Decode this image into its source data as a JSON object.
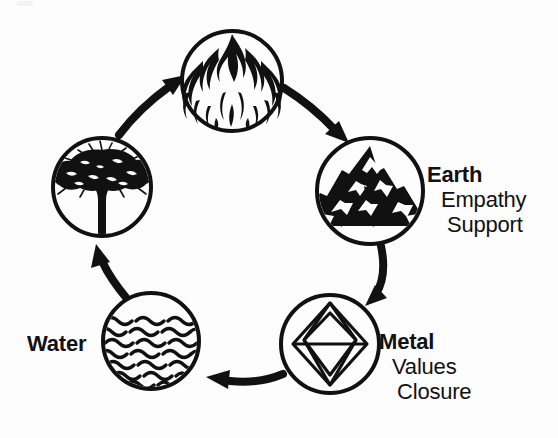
{
  "diagram": {
    "type": "cycle",
    "direction": "clockwise",
    "background_color": "#fdfdfd",
    "stroke_color": "#111111"
  },
  "nodes": [
    {
      "id": "fire",
      "icon": "flame-icon",
      "element": "Fire",
      "cx": 232,
      "cy": 81,
      "r": 51
    },
    {
      "id": "earth",
      "icon": "mountain-icon",
      "element": "Earth",
      "cx": 370,
      "cy": 191,
      "r": 54
    },
    {
      "id": "metal",
      "icon": "diamond-icon",
      "element": "Metal",
      "cx": 330,
      "cy": 344,
      "r": 50
    },
    {
      "id": "water",
      "icon": "waves-icon",
      "element": "Water",
      "cx": 151,
      "cy": 341,
      "r": 49
    },
    {
      "id": "wood",
      "icon": "tree-icon",
      "element": "Wood",
      "cx": 102,
      "cy": 187,
      "r": 50
    }
  ],
  "arrows": [
    {
      "id": "wood-to-fire",
      "from": "wood",
      "to": "fire",
      "icon": "curved-arrow-icon"
    },
    {
      "id": "fire-to-earth",
      "from": "fire",
      "to": "earth",
      "icon": "curved-arrow-icon"
    },
    {
      "id": "earth-to-metal",
      "from": "earth",
      "to": "metal",
      "icon": "curved-arrow-icon"
    },
    {
      "id": "metal-to-water",
      "from": "metal",
      "to": "water",
      "icon": "curved-arrow-icon"
    },
    {
      "id": "water-to-wood",
      "from": "water",
      "to": "wood",
      "icon": "curved-arrow-icon"
    }
  ],
  "labels": {
    "earth": {
      "title": "Earth",
      "sub1": "Empathy",
      "sub2": "Support"
    },
    "metal": {
      "title": "Metal",
      "sub1": "Values",
      "sub2": "Closure"
    },
    "water": {
      "title": "Water"
    }
  }
}
